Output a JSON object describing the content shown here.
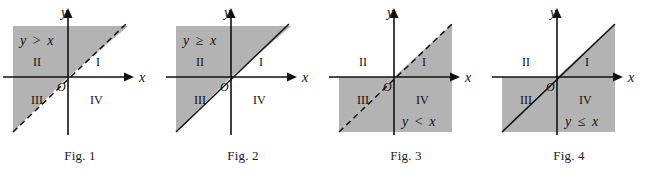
{
  "page": {
    "background_color": "#ffffff",
    "shade_color": "#b3b3b3",
    "line_color": "#111111",
    "figure_count": 4
  },
  "figures": [
    {
      "id": "fig-1",
      "caption": "Fig. 1",
      "inequality": "y > x",
      "inequality_lhs": "y",
      "inequality_op": ">",
      "inequality_rhs": "x",
      "boundary_style": "dashed",
      "shaded_side": "above-left",
      "x_axis_label": "x",
      "y_axis_label": "y",
      "origin_label": "O",
      "quadrants": [
        "I",
        "II",
        "III",
        "IV"
      ],
      "inequality_position": "top-left"
    },
    {
      "id": "fig-2",
      "caption": "Fig. 2",
      "inequality": "y ≥ x",
      "inequality_lhs": "y",
      "inequality_op": "≥",
      "inequality_rhs": "x",
      "boundary_style": "solid",
      "shaded_side": "above-left",
      "x_axis_label": "x",
      "y_axis_label": "y",
      "origin_label": "O",
      "quadrants": [
        "I",
        "II",
        "III",
        "IV"
      ],
      "inequality_position": "top-left"
    },
    {
      "id": "fig-3",
      "caption": "Fig. 3",
      "inequality": "y < x",
      "inequality_lhs": "y",
      "inequality_op": "<",
      "inequality_rhs": "x",
      "boundary_style": "dashed",
      "shaded_side": "below-right",
      "x_axis_label": "x",
      "y_axis_label": "y",
      "origin_label": "O",
      "quadrants": [
        "I",
        "II",
        "III",
        "IV"
      ],
      "inequality_position": "bottom-right"
    },
    {
      "id": "fig-4",
      "caption": "Fig. 4",
      "inequality": "y ≤ x",
      "inequality_lhs": "y",
      "inequality_op": "≤",
      "inequality_rhs": "x",
      "boundary_style": "solid",
      "shaded_side": "below-right",
      "x_axis_label": "x",
      "y_axis_label": "y",
      "origin_label": "O",
      "quadrants": [
        "I",
        "II",
        "III",
        "IV"
      ],
      "inequality_position": "bottom-right"
    }
  ]
}
